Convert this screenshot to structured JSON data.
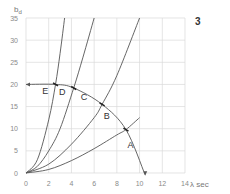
{
  "chart_data": {
    "type": "line",
    "panel_label": "3",
    "title": "",
    "xlabel": "λ sec",
    "ylabel": "b",
    "ylabel_sub": "d",
    "xlim": [
      0,
      14
    ],
    "ylim": [
      0,
      35
    ],
    "xticks": [
      0,
      2,
      4,
      6,
      8,
      10,
      12,
      14
    ],
    "yticks": [
      0,
      5,
      10,
      15,
      20,
      25,
      30,
      35
    ],
    "grid": true,
    "series": [
      {
        "name": "curve-1",
        "x": [
          0,
          1,
          2,
          2.6,
          3,
          3.4
        ],
        "y": [
          0,
          3,
          12,
          20,
          27,
          35
        ]
      },
      {
        "name": "curve-2",
        "x": [
          0,
          1,
          2,
          3,
          4.2,
          5,
          6
        ],
        "y": [
          0,
          1.5,
          5,
          10,
          19.2,
          26,
          35
        ]
      },
      {
        "name": "curve-3",
        "x": [
          0,
          2,
          4,
          6,
          6.7,
          8,
          10
        ],
        "y": [
          0,
          2,
          6.5,
          12.5,
          15.5,
          22,
          35
        ]
      },
      {
        "name": "curve-4",
        "x": [
          0,
          2,
          4,
          6,
          8,
          8.8,
          10
        ],
        "y": [
          0,
          0.8,
          2.8,
          5.5,
          8.6,
          9.8,
          12.5
        ]
      }
    ],
    "operating_curve": {
      "name": "arrow-curve",
      "x": [
        0,
        2.6,
        4.2,
        6.7,
        8.8,
        10.5
      ],
      "y": [
        20,
        20,
        19.2,
        15.5,
        9.8,
        -0.5
      ]
    },
    "annotations": [
      {
        "text": "E",
        "x": 1.7,
        "y": 17.8
      },
      {
        "text": "D",
        "x": 3.2,
        "y": 17.6
      },
      {
        "text": "C",
        "x": 5.1,
        "y": 16.4
      },
      {
        "text": "B",
        "x": 7.1,
        "y": 12.3
      },
      {
        "text": "A",
        "x": 9.2,
        "y": 5.6
      }
    ]
  },
  "colors": {
    "grid": "#d9d9d9",
    "curve": "#555555",
    "text": "#333333"
  }
}
